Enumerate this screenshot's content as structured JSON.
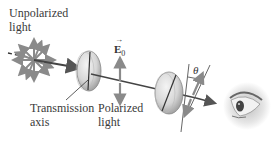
{
  "diagram": {
    "labels": {
      "unpolarized_line1": "Unpolarized",
      "unpolarized_line2": "light",
      "transmission_line1": "Transmission",
      "transmission_line2": "axis",
      "polarized_line1": "Polarized",
      "polarized_line2": "light",
      "e_field_symbol": "E",
      "e_field_subscript": "0",
      "angle_symbol": "θ"
    },
    "icons": {
      "source": "unpolarized-starburst-icon",
      "polarizer1": "polarizer-disk-icon",
      "polarizer2": "analyzer-disk-icon",
      "observer": "eye-icon"
    },
    "colors": {
      "arrow_gray": "#8a8a8a",
      "beam_dark": "#3a3a3a",
      "disk_fill": "#d9d9d9",
      "text": "#3a3a3a"
    }
  }
}
